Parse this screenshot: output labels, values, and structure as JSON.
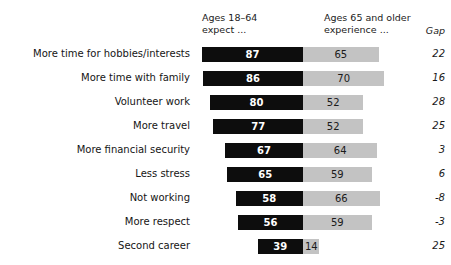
{
  "chart_data": {
    "type": "bar",
    "subtype": "diverging-paired-bar",
    "title": "",
    "xlabel": "",
    "ylabel": "",
    "grid": false,
    "legend_position": "top",
    "headers": {
      "left": "Ages 18–64\nexpect ...",
      "right": "Ages 65 and older\nexperience ...",
      "gap": "Gap"
    },
    "series": [
      {
        "name": "Ages 18–64 expect ...",
        "color": "#0d0d0d",
        "values": [
          87,
          86,
          80,
          77,
          67,
          65,
          58,
          56,
          39
        ]
      },
      {
        "name": "Ages 65 and older experience ...",
        "color": "#c3c3c3",
        "values": [
          65,
          70,
          52,
          52,
          64,
          59,
          66,
          59,
          14
        ]
      }
    ],
    "categories": [
      "More time for hobbies/interests",
      "More time with family",
      "Volunteer work",
      "More travel",
      "More financial security",
      "Less stress",
      "Not working",
      "More respect",
      "Second career"
    ],
    "gap": [
      22,
      16,
      28,
      25,
      3,
      6,
      -8,
      -3,
      25
    ],
    "rows": [
      {
        "label": "More time for hobbies/interests",
        "expect": 87,
        "experience": 65,
        "gap": "22"
      },
      {
        "label": "More time with family",
        "expect": 86,
        "experience": 70,
        "gap": "16"
      },
      {
        "label": "Volunteer work",
        "expect": 80,
        "experience": 52,
        "gap": "28"
      },
      {
        "label": "More travel",
        "expect": 77,
        "experience": 52,
        "gap": "25"
      },
      {
        "label": "More financial security",
        "expect": 67,
        "experience": 64,
        "gap": "3"
      },
      {
        "label": "Less stress",
        "expect": 65,
        "experience": 59,
        "gap": "6"
      },
      {
        "label": "Not working",
        "expect": 58,
        "experience": 66,
        "gap": "-8"
      },
      {
        "label": "More respect",
        "expect": 56,
        "experience": 59,
        "gap": "-3"
      },
      {
        "label": "Second career",
        "expect": 39,
        "experience": 14,
        "gap": "25"
      }
    ],
    "axis": {
      "center_x_px": 303,
      "px_per_unit": 1.163,
      "bar_height_px": 15,
      "row_pitch_px": 24,
      "first_row_top_px": 44
    }
  }
}
